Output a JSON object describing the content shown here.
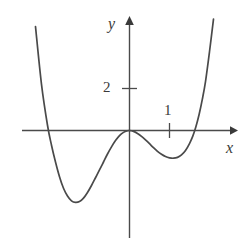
{
  "figure": {
    "title": "",
    "background_color": "#ffffff",
    "stroke_color": "#4a4a4a",
    "text_color": "#3a3a3a",
    "width": 251,
    "height": 242
  },
  "labels": {
    "x_axis": "x",
    "y_axis": "y",
    "tick_x_1": "1",
    "tick_y_2": "2"
  },
  "chart_data": {
    "type": "line",
    "title": "",
    "xlabel": "x",
    "ylabel": "y",
    "grid": false,
    "legend": null,
    "axis_style": "arrows-both-ends",
    "xticks": [
      1
    ],
    "xtick_labels": [
      "1"
    ],
    "yticks": [
      2
    ],
    "ytick_labels": [
      "2"
    ],
    "xlim": [
      -2.7,
      2.65
    ],
    "ylim": [
      -5.2,
      5.3
    ],
    "annotations": [
      {
        "text": "local maximum touching x-axis at origin",
        "x": 0,
        "y": 0
      },
      {
        "text": "left local minimum",
        "x": -1.4,
        "y": -3.4
      },
      {
        "text": "right local minimum",
        "x": 1.28,
        "y": -1.3
      }
    ],
    "series": [
      {
        "name": "curve",
        "x": [
          -2.35,
          -2.2,
          -2.05,
          -1.95,
          -1.85,
          -1.75,
          -1.65,
          -1.55,
          -1.45,
          -1.35,
          -1.25,
          -1.15,
          -1.05,
          -0.95,
          -0.85,
          -0.75,
          -0.65,
          -0.55,
          -0.45,
          -0.35,
          -0.25,
          -0.15,
          -0.05,
          0.0,
          0.1,
          0.2,
          0.3,
          0.4,
          0.5,
          0.6,
          0.7,
          0.8,
          0.9,
          1.0,
          1.1,
          1.2,
          1.3,
          1.4,
          1.5,
          1.58,
          1.66,
          1.74,
          1.82,
          1.9,
          2.0,
          2.1
        ],
        "y": [
          4.95,
          2.2,
          0.25,
          -0.7,
          -1.5,
          -2.2,
          -2.75,
          -3.12,
          -3.35,
          -3.42,
          -3.38,
          -3.22,
          -2.95,
          -2.62,
          -2.25,
          -1.88,
          -1.5,
          -1.12,
          -0.78,
          -0.48,
          -0.24,
          -0.09,
          -0.01,
          0.0,
          -0.04,
          -0.14,
          -0.28,
          -0.45,
          -0.63,
          -0.82,
          -0.99,
          -1.13,
          -1.24,
          -1.3,
          -1.32,
          -1.28,
          -1.16,
          -0.95,
          -0.62,
          -0.28,
          0.18,
          0.76,
          1.48,
          2.33,
          3.75,
          5.3
        ]
      }
    ]
  }
}
